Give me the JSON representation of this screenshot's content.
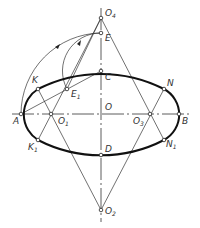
{
  "colors": {
    "background": "#ffffff",
    "stroke": "#2a2a2a",
    "ellipse": "#111111",
    "label": "#333333"
  },
  "points": {
    "O4": {
      "label": "O",
      "sub": "4",
      "x": 101,
      "y": 18
    },
    "E": {
      "label": "E",
      "sub": "",
      "x": 101,
      "y": 33
    },
    "C": {
      "label": "C",
      "sub": "",
      "x": 101,
      "y": 71
    },
    "O": {
      "label": "O",
      "sub": "",
      "x": 101,
      "y": 114
    },
    "D": {
      "label": "D",
      "sub": "",
      "x": 101,
      "y": 155
    },
    "O2": {
      "label": "O",
      "sub": "2",
      "x": 101,
      "y": 210
    },
    "A": {
      "label": "A",
      "sub": "",
      "x": 21,
      "y": 114
    },
    "B": {
      "label": "B",
      "sub": "",
      "x": 179,
      "y": 114
    },
    "O1": {
      "label": "O",
      "sub": "1",
      "x": 51,
      "y": 114
    },
    "O3": {
      "label": "O",
      "sub": "3",
      "x": 150,
      "y": 114
    },
    "K": {
      "label": "K",
      "sub": "",
      "x": 38,
      "y": 89
    },
    "K1": {
      "label": "K",
      "sub": "1",
      "x": 38,
      "y": 140
    },
    "N": {
      "label": "N",
      "sub": "",
      "x": 164,
      "y": 89
    },
    "N1": {
      "label": "N",
      "sub": "1",
      "x": 164,
      "y": 140
    },
    "E1": {
      "label": "E",
      "sub": "1",
      "x": 67,
      "y": 89
    }
  }
}
